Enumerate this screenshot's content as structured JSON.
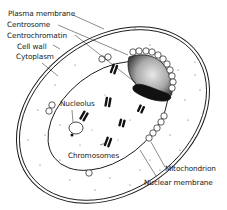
{
  "diagram": {
    "labels": {
      "plasma_membrane": "Plasma membrane",
      "centrosome": "Centrosome",
      "centrochromatin": "Centrochromatin",
      "cell_wall": "Cell wall",
      "cytoplasm": "Cytoplasm",
      "nucleolus": "Nucleolus",
      "chromosomes": "Chromosomes",
      "mitochondrion": "Mitochondrion",
      "nuclear_membrane": "Nuclear membrane"
    },
    "colors": {
      "line": "#1a1a1a",
      "background": "#ffffff",
      "centrosome_fill": "#9a9a9a",
      "centrochromatin_fill": "#111111"
    }
  }
}
